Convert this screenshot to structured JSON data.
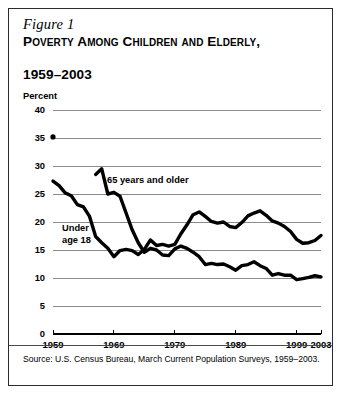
{
  "figure": {
    "label": "Figure 1",
    "title_line1": "Poverty Among Children and Elderly,",
    "title_line2": "1959–2003",
    "source": "Source: U.S. Census Bureau, March Current Population Surveys, 1959–2003."
  },
  "chart_data": {
    "type": "line",
    "title": "Poverty Among Children and Elderly, 1959–2003",
    "xlabel": "",
    "ylabel": "Percent",
    "ylim": [
      0,
      40
    ],
    "xlim": [
      1959,
      2003
    ],
    "yticks": [
      0,
      5,
      10,
      15,
      20,
      25,
      30,
      35,
      40
    ],
    "xticks": [
      1959,
      1969,
      1979,
      1989,
      1999,
      2003
    ],
    "grid": true,
    "legend_position": "inline-annotation",
    "x": [
      1959,
      1960,
      1961,
      1962,
      1963,
      1964,
      1965,
      1966,
      1967,
      1968,
      1969,
      1970,
      1971,
      1972,
      1973,
      1974,
      1975,
      1976,
      1977,
      1978,
      1979,
      1980,
      1981,
      1982,
      1983,
      1984,
      1985,
      1986,
      1987,
      1988,
      1989,
      1990,
      1991,
      1992,
      1993,
      1994,
      1995,
      1996,
      1997,
      1998,
      1999,
      2000,
      2001,
      2002,
      2003
    ],
    "series": [
      {
        "name": "Under age 18",
        "annotation": "Under age 18",
        "values": [
          27.3,
          26.5,
          25.2,
          24.7,
          23.1,
          22.7,
          21.0,
          17.4,
          16.3,
          15.3,
          13.8,
          14.9,
          15.1,
          14.9,
          14.2,
          15.1,
          16.8,
          15.8,
          16.0,
          15.7,
          16.0,
          17.9,
          19.5,
          21.3,
          21.8,
          21.0,
          20.1,
          19.8,
          20.0,
          19.2,
          19.0,
          19.9,
          21.1,
          21.6,
          22.0,
          21.2,
          20.2,
          19.8,
          19.2,
          18.3,
          16.9,
          16.2,
          16.3,
          16.7,
          17.6
        ],
        "style": "solid-thick"
      },
      {
        "name": "65 years and older",
        "annotation": "65 years and older",
        "values": [
          35.2,
          null,
          null,
          null,
          null,
          null,
          null,
          28.5,
          29.5,
          25.0,
          25.3,
          24.6,
          21.6,
          18.6,
          16.3,
          14.6,
          15.3,
          15.0,
          14.1,
          14.0,
          15.2,
          15.7,
          15.3,
          14.6,
          13.8,
          12.4,
          12.6,
          12.4,
          12.5,
          12.0,
          11.4,
          12.2,
          12.4,
          12.9,
          12.2,
          11.7,
          10.5,
          10.8,
          10.5,
          10.5,
          9.7,
          9.9,
          10.1,
          10.4,
          10.2
        ],
        "style": "solid-thick",
        "isolated_point": {
          "x": 1959,
          "y": 35.2
        }
      }
    ]
  },
  "axis": {
    "y_tick_labels": [
      "40",
      "35",
      "30",
      "25",
      "20",
      "15",
      "10",
      "5",
      "0"
    ],
    "x_tick_labels": [
      "1959",
      "1969",
      "1979",
      "1989",
      "1999",
      "2003"
    ],
    "percent_label": "Percent"
  },
  "annotations": {
    "elderly": "65 years and older",
    "children_line1": "Under",
    "children_line2": "age 18"
  },
  "colors": {
    "line": "#000000",
    "grid": "#8a8a8a",
    "border": "#2b2b2b",
    "background": "#ffffff"
  }
}
